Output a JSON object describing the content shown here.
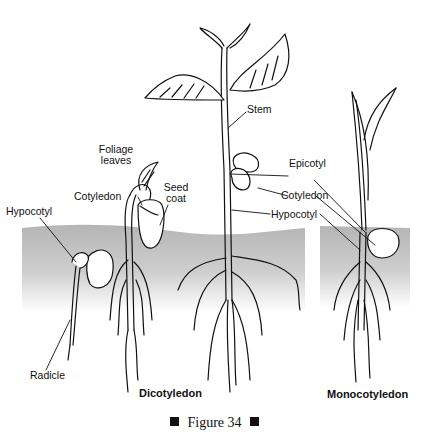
{
  "figure": {
    "caption": "Figure 34",
    "caption_marker_left": "square-bullet",
    "caption_marker_right": "square-bullet"
  },
  "panels": {
    "dicot": {
      "title": "Dicotyledon",
      "labels": {
        "hypocotyl_left": "Hypocotyl",
        "radicle": "Radicle",
        "foliage_leaves_line1": "Foliage",
        "foliage_leaves_line2": "leaves",
        "cotyledon_left": "Cotyledon",
        "seed_coat_line1": "Seed",
        "seed_coat_line2": "coat",
        "stem": "Stem",
        "epicotyl": "Epicotyl",
        "cotyledon_right": "Cotyledon",
        "hypocotyl_right": "Hypocotyl"
      }
    },
    "monocot": {
      "title": "Monocotyledon"
    }
  },
  "colors": {
    "ink": "#111111",
    "soil_top": "#b9b9b9",
    "soil_bottom": "#f2f2f2",
    "background": "#ffffff"
  }
}
